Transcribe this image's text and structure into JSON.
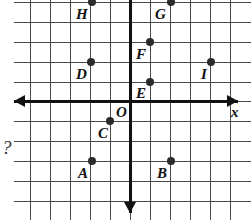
{
  "figure": {
    "type": "coordinate-plane",
    "width": 251,
    "height": 220,
    "background_color": "#ffffff",
    "grid_color": "#4a4a4a",
    "axis_color": "#111111",
    "point_color": "#2b2b2b",
    "label_color": "#111111"
  },
  "axes": {
    "x_axis_label": "x",
    "y_axis_label": "",
    "origin_label": "O",
    "origin_px": {
      "x": 130,
      "y": 101
    },
    "grid_spacing_px": 20,
    "x_range": [
      -6,
      6
    ],
    "y_range": [
      -5,
      5
    ],
    "x_arrow_left": true,
    "x_arrow_right": true,
    "y_arrow_down": true,
    "y_arrow_up": false
  },
  "grid": {
    "vertical_px": [
      30,
      50,
      70,
      90,
      110,
      130,
      150,
      170,
      190,
      210,
      230
    ],
    "horizontal_px": [
      2,
      22,
      42,
      62,
      82,
      101,
      121,
      141,
      161,
      181,
      201
    ]
  },
  "margin_text": "?",
  "chart_data": {
    "type": "scatter",
    "title": "",
    "xlabel": "x",
    "ylabel": "",
    "xlim": [
      -6,
      6
    ],
    "ylim": [
      -5,
      5
    ],
    "grid": true,
    "legend": "none",
    "points": [
      {
        "label": "A",
        "x": -2,
        "y": -3,
        "px": 92,
        "py": 161,
        "label_px": 78,
        "label_py": 166
      },
      {
        "label": "B",
        "x": 2,
        "y": -3,
        "px": 171,
        "py": 161,
        "label_px": 157,
        "label_py": 166
      },
      {
        "label": "C",
        "x": -1,
        "y": -1,
        "px": 110,
        "py": 121,
        "label_px": 98,
        "label_py": 126
      },
      {
        "label": "D",
        "x": -2,
        "y": 2,
        "px": 91,
        "py": 62,
        "label_px": 76,
        "label_py": 67
      },
      {
        "label": "E",
        "x": 1,
        "y": 1,
        "px": 150,
        "py": 82,
        "label_px": 136,
        "label_py": 86
      },
      {
        "label": "F",
        "x": 1,
        "y": 3,
        "px": 150,
        "py": 42,
        "label_px": 136,
        "label_py": 47
      },
      {
        "label": "G",
        "x": 2,
        "y": 5,
        "px": 171,
        "py": 2,
        "label_px": 155,
        "label_py": 7
      },
      {
        "label": "H",
        "x": -2,
        "y": 5,
        "px": 92,
        "py": 2,
        "label_px": 76,
        "label_py": 7
      },
      {
        "label": "I",
        "x": 4,
        "y": 2,
        "px": 211,
        "py": 62,
        "label_px": 201,
        "label_py": 67
      }
    ]
  }
}
